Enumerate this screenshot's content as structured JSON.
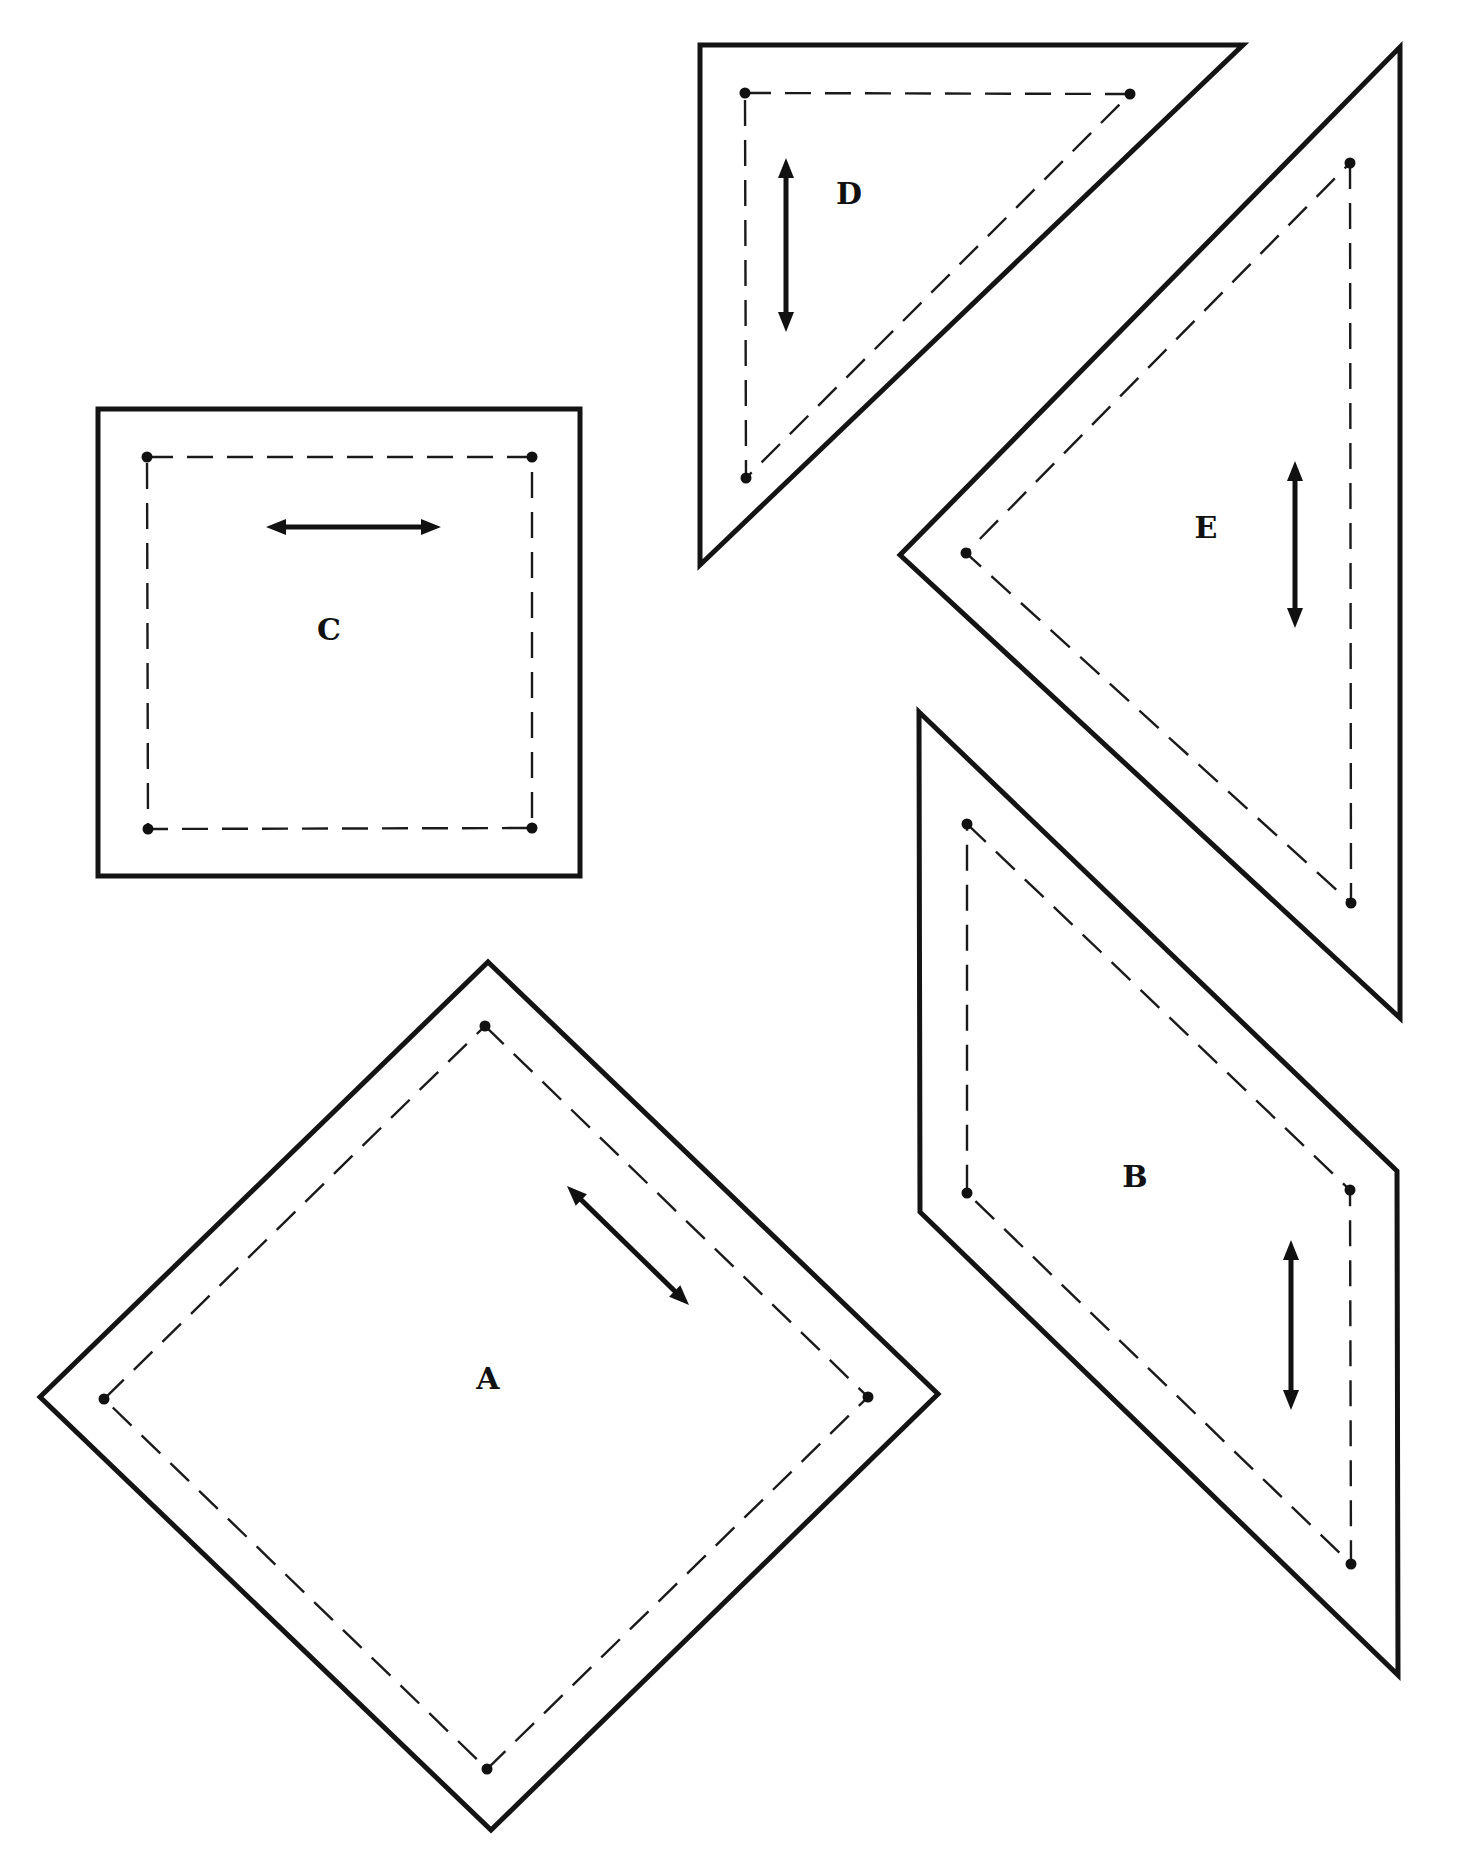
{
  "page": {
    "width": 1467,
    "height": 1871,
    "background": "#ffffff",
    "line_color": "#141414"
  },
  "pieces": [
    {
      "id": "A",
      "label": "A",
      "shape": "diamond",
      "cut_line": [
        [
          488,
          962
        ],
        [
          938,
          1394
        ],
        [
          491,
          1830
        ],
        [
          40,
          1397
        ]
      ],
      "seam_line": [
        [
          485,
          1026
        ],
        [
          868,
          1397
        ],
        [
          487,
          1769
        ],
        [
          104,
          1399
        ]
      ],
      "grain_arrow": {
        "from": [
          567,
          1186
        ],
        "to": [
          689,
          1305
        ],
        "direction": "diagonal"
      },
      "label_pos": [
        488,
        1379
      ]
    },
    {
      "id": "B",
      "label": "B",
      "shape": "trapezoid",
      "cut_line": [
        [
          919,
          712
        ],
        [
          1397,
          1171
        ],
        [
          1398,
          1675
        ],
        [
          920,
          1212
        ]
      ],
      "seam_line": [
        [
          967,
          824
        ],
        [
          1350,
          1190
        ],
        [
          1351,
          1564
        ],
        [
          967,
          1193
        ]
      ],
      "grain_arrow": {
        "from": [
          1291,
          1240
        ],
        "to": [
          1291,
          1410
        ],
        "direction": "vertical"
      },
      "label_pos": [
        1135,
        1177
      ]
    },
    {
      "id": "C",
      "label": "C",
      "shape": "square",
      "cut_line": [
        [
          98,
          409
        ],
        [
          580,
          409
        ],
        [
          580,
          876
        ],
        [
          98,
          876
        ]
      ],
      "seam_line": [
        [
          147,
          457
        ],
        [
          532,
          457
        ],
        [
          532,
          828
        ],
        [
          148,
          829
        ]
      ],
      "grain_arrow": {
        "from": [
          266,
          527
        ],
        "to": [
          441,
          527
        ],
        "direction": "horizontal"
      },
      "label_pos": [
        329,
        630
      ]
    },
    {
      "id": "D",
      "label": "D",
      "shape": "right-triangle",
      "cut_line": [
        [
          700,
          45
        ],
        [
          1243,
          45
        ],
        [
          700,
          565
        ]
      ],
      "seam_line": [
        [
          745,
          93
        ],
        [
          1130,
          94
        ],
        [
          746,
          478
        ]
      ],
      "grain_arrow": {
        "from": [
          786,
          158
        ],
        "to": [
          786,
          332
        ],
        "direction": "vertical"
      },
      "label_pos": [
        849,
        194
      ]
    },
    {
      "id": "E",
      "label": "E",
      "shape": "triangle",
      "cut_line": [
        [
          1400,
          47
        ],
        [
          1400,
          1018
        ],
        [
          900,
          555
        ]
      ],
      "seam_line": [
        [
          1350,
          163
        ],
        [
          1351,
          903
        ],
        [
          966,
          553
        ]
      ],
      "grain_arrow": {
        "from": [
          1295,
          461
        ],
        "to": [
          1295,
          628
        ],
        "direction": "vertical"
      },
      "label_pos": [
        1206,
        528
      ]
    }
  ]
}
